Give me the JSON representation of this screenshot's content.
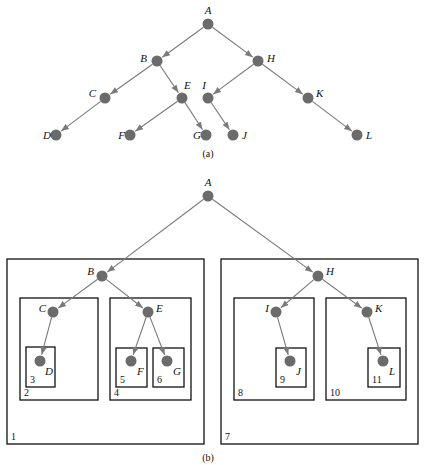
{
  "tree_a": {
    "caption": "(a)",
    "caption_pos": [
      208,
      157
    ],
    "nodes": [
      {
        "id": "A",
        "x": 208,
        "y": 24,
        "lx": 208,
        "ly": 14,
        "anchor": "middle"
      },
      {
        "id": "B",
        "x": 157,
        "y": 61,
        "lx": 147,
        "ly": 62,
        "anchor": "end"
      },
      {
        "id": "H",
        "x": 258,
        "y": 61,
        "lx": 267,
        "ly": 62,
        "anchor": "start"
      },
      {
        "id": "C",
        "x": 105,
        "y": 98,
        "lx": 96,
        "ly": 97,
        "anchor": "end"
      },
      {
        "id": "E",
        "x": 182,
        "y": 98,
        "lx": 184,
        "ly": 89,
        "anchor": "start"
      },
      {
        "id": "I",
        "x": 208,
        "y": 98,
        "lx": 206,
        "ly": 89,
        "anchor": "end"
      },
      {
        "id": "K",
        "x": 308,
        "y": 98,
        "lx": 316,
        "ly": 97,
        "anchor": "start"
      },
      {
        "id": "D",
        "x": 56,
        "y": 135,
        "lx": 51,
        "ly": 139,
        "anchor": "end"
      },
      {
        "id": "F",
        "x": 130,
        "y": 135,
        "lx": 125,
        "ly": 139,
        "anchor": "end"
      },
      {
        "id": "G",
        "x": 206,
        "y": 135,
        "lx": 201,
        "ly": 139,
        "anchor": "end"
      },
      {
        "id": "J",
        "x": 233,
        "y": 135,
        "lx": 242,
        "ly": 139,
        "anchor": "start"
      },
      {
        "id": "L",
        "x": 357,
        "y": 135,
        "lx": 366,
        "ly": 139,
        "anchor": "start"
      }
    ],
    "edges": [
      [
        "A",
        "B"
      ],
      [
        "A",
        "H"
      ],
      [
        "B",
        "C"
      ],
      [
        "B",
        "E"
      ],
      [
        "C",
        "D"
      ],
      [
        "E",
        "F"
      ],
      [
        "E",
        "G"
      ],
      [
        "H",
        "I"
      ],
      [
        "H",
        "K"
      ],
      [
        "I",
        "J"
      ],
      [
        "K",
        "L"
      ]
    ]
  },
  "tree_b": {
    "caption": "(b)",
    "caption_pos": [
      208,
      461
    ],
    "nodes": [
      {
        "id": "A",
        "x": 208,
        "y": 196,
        "lx": 208,
        "ly": 186,
        "anchor": "middle"
      },
      {
        "id": "B",
        "x": 102,
        "y": 276,
        "lx": 94,
        "ly": 275,
        "anchor": "end"
      },
      {
        "id": "H",
        "x": 318,
        "y": 276,
        "lx": 326,
        "ly": 275,
        "anchor": "start"
      },
      {
        "id": "C",
        "x": 53,
        "y": 312,
        "lx": 46,
        "ly": 312,
        "anchor": "end"
      },
      {
        "id": "E",
        "x": 148,
        "y": 312,
        "lx": 156,
        "ly": 312,
        "anchor": "start"
      },
      {
        "id": "I",
        "x": 276,
        "y": 312,
        "lx": 269,
        "ly": 312,
        "anchor": "end"
      },
      {
        "id": "K",
        "x": 367,
        "y": 312,
        "lx": 375,
        "ly": 312,
        "anchor": "start"
      },
      {
        "id": "D",
        "x": 40,
        "y": 361,
        "lx": 45,
        "ly": 375,
        "anchor": "start"
      },
      {
        "id": "F",
        "x": 131,
        "y": 361,
        "lx": 137,
        "ly": 375,
        "anchor": "start"
      },
      {
        "id": "G",
        "x": 167,
        "y": 361,
        "lx": 173,
        "ly": 375,
        "anchor": "start"
      },
      {
        "id": "J",
        "x": 290,
        "y": 361,
        "lx": 296,
        "ly": 375,
        "anchor": "start"
      },
      {
        "id": "L",
        "x": 383,
        "y": 361,
        "lx": 389,
        "ly": 375,
        "anchor": "start"
      }
    ],
    "edges": [
      [
        "A",
        "B"
      ],
      [
        "A",
        "H"
      ],
      [
        "B",
        "C"
      ],
      [
        "B",
        "E"
      ],
      [
        "C",
        "D"
      ],
      [
        "E",
        "F"
      ],
      [
        "E",
        "G"
      ],
      [
        "H",
        "I"
      ],
      [
        "H",
        "K"
      ],
      [
        "I",
        "J"
      ],
      [
        "K",
        "L"
      ]
    ],
    "boxes": [
      {
        "label": "1",
        "x": 7,
        "y": 259,
        "w": 197,
        "h": 185
      },
      {
        "label": "2",
        "x": 20,
        "y": 298,
        "w": 78,
        "h": 102
      },
      {
        "label": "3",
        "x": 26,
        "y": 347,
        "w": 29,
        "h": 40
      },
      {
        "label": "4",
        "x": 110,
        "y": 298,
        "w": 81,
        "h": 102
      },
      {
        "label": "5",
        "x": 116,
        "y": 348,
        "w": 31,
        "h": 39
      },
      {
        "label": "6",
        "x": 153,
        "y": 348,
        "w": 31,
        "h": 39
      },
      {
        "label": "7",
        "x": 221,
        "y": 259,
        "w": 197,
        "h": 185
      },
      {
        "label": "8",
        "x": 234,
        "y": 298,
        "w": 80,
        "h": 102
      },
      {
        "label": "9",
        "x": 276,
        "y": 348,
        "w": 30,
        "h": 39
      },
      {
        "label": "10",
        "x": 326,
        "y": 298,
        "w": 80,
        "h": 102
      },
      {
        "label": "11",
        "x": 368,
        "y": 348,
        "w": 32,
        "h": 39
      }
    ]
  },
  "style": {
    "node_color": "#6b6b6b",
    "edge_color": "#7a7a7a",
    "box_color": "#111111"
  }
}
